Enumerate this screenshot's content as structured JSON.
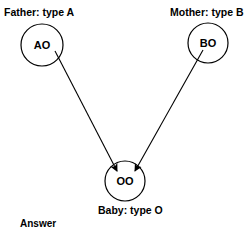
{
  "father": {
    "label": "Father: type A",
    "genotype": "AO"
  },
  "mother": {
    "label": "Mother: type B",
    "genotype": "BO"
  },
  "baby": {
    "label": "Baby: type O",
    "genotype": "OO"
  },
  "footer": {
    "answer_label": "Answer"
  },
  "colors": {
    "ink": "#000000",
    "background": "#ffffff"
  }
}
